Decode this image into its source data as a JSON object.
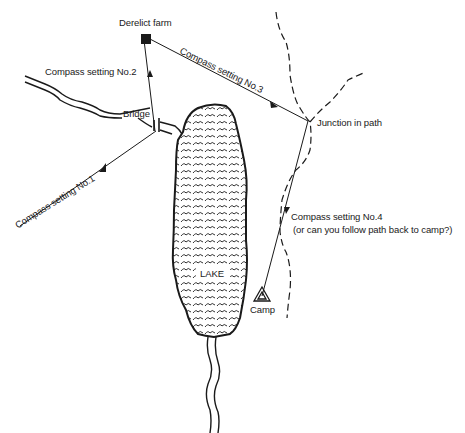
{
  "map": {
    "features": {
      "farm": {
        "label": "Derelict farm",
        "icon": "filled-square"
      },
      "bridge": {
        "label": "Bridge"
      },
      "junction": {
        "label": "Junction in path"
      },
      "lake": {
        "label": "LAKE"
      },
      "camp": {
        "label": "Camp",
        "icon": "tent-triangle"
      }
    },
    "routes": [
      {
        "label": "Compass setting No.1"
      },
      {
        "label": "Compass setting No.2"
      },
      {
        "label": "Compass setting No.3"
      },
      {
        "label": "Compass setting No.4",
        "note": "(or can you follow path back to camp?)"
      }
    ],
    "colors": {
      "ink": "#1a1a1a",
      "background": "#ffffff"
    }
  }
}
